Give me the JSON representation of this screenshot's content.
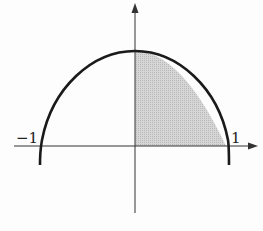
{
  "diagram": {
    "type": "function-graph",
    "curve": "parabola-like arch through (-1,0), (0,top), (1,0)",
    "shaded_region": "area under curve from x=0 to x=1",
    "labels": {
      "left_intercept": "−1",
      "right_intercept": "1"
    },
    "colors": {
      "curve": "#1a1a1a",
      "axes": "#333333",
      "shade": "#cfcfcf"
    }
  }
}
